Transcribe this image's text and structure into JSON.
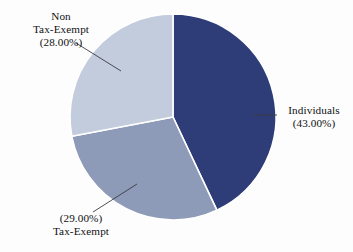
{
  "figure": {
    "background_color": "#fdfdfe",
    "separator_color": "#ffffff",
    "leader_line_color": "#3a3a42",
    "text_color": "#111111"
  },
  "chart_data": {
    "type": "pie",
    "title": "",
    "xlabel": "",
    "ylabel": "",
    "grid": false,
    "legend_position": "none",
    "label_placement": "outside-with-leader-lines",
    "start_angle_deg": 0,
    "direction": "clockwise",
    "center": {
      "x": 173,
      "y": 117
    },
    "radius": 103,
    "categories": [
      "Individuals",
      "Tax-Exempt",
      "Non Tax-Exempt"
    ],
    "values": [
      43.0,
      29.0,
      28.0
    ],
    "value_labels": [
      "(43.00%)",
      "(29.00%)",
      "(28.00%)"
    ],
    "colors": [
      "#2e3c78",
      "#8d9bb8",
      "#c3ccdd"
    ],
    "slices": [
      {
        "name": "Individuals",
        "value": 43.0,
        "value_label": "(43.00%)",
        "color": "#2e3c78",
        "start_angle_deg": 0.0,
        "end_angle_deg": 154.8,
        "label_lines": [
          "Individuals",
          "(43.00%)"
        ]
      },
      {
        "name": "Tax-Exempt",
        "value": 29.0,
        "value_label": "(29.00%)",
        "color": "#8d9bb8",
        "start_angle_deg": 154.8,
        "end_angle_deg": 259.2,
        "label_lines": [
          "(29.00%)",
          "Tax-Exempt"
        ]
      },
      {
        "name": "Non Tax-Exempt",
        "value": 28.0,
        "value_label": "(28.00%)",
        "color": "#c3ccdd",
        "start_angle_deg": 259.2,
        "end_angle_deg": 360.0,
        "label_lines": [
          "Non",
          "Tax-Exempt",
          "(28.00%)"
        ]
      }
    ]
  },
  "labels": {
    "non_tax_exempt": {
      "line1": "Non",
      "line2": "Tax-Exempt",
      "line3": "(28.00%)"
    },
    "individuals": {
      "line1": "Individuals",
      "line2": "(43.00%)"
    },
    "tax_exempt": {
      "line1": "(29.00%)",
      "line2": "Tax-Exempt"
    }
  }
}
